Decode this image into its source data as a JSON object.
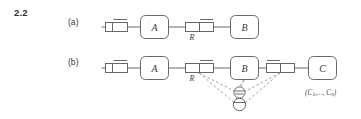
{
  "figure": {
    "number": "2.2",
    "panels": [
      {
        "id": "a",
        "label": "(a)"
      },
      {
        "id": "b",
        "label": "(b)"
      }
    ]
  },
  "row_a": {
    "source_name": "source-symbol",
    "blocks": [
      {
        "id": "A",
        "label": "A"
      },
      {
        "id": "B",
        "label": "B"
      }
    ],
    "channel": {
      "label": "R",
      "name": "channel-r"
    }
  },
  "row_b": {
    "source_name": "source-symbol",
    "blocks": [
      {
        "id": "A",
        "label": "A"
      },
      {
        "id": "B",
        "label": "B"
      },
      {
        "id": "C",
        "label": "C"
      }
    ],
    "channel": {
      "label": "R",
      "name": "channel-r"
    },
    "second_channel": {
      "label": "",
      "name": "channel-second"
    },
    "nodes": [
      {
        "id": "node-upper",
        "label": ""
      },
      {
        "id": "node-lower",
        "label": ""
      }
    ],
    "tuple_annotation": {
      "open": "(",
      "first": "C",
      "first_sub": "1",
      "ellipsis": ",...,",
      "last": "C",
      "last_sub": "n",
      "close": ")"
    }
  },
  "colors": {
    "stroke": "#58585a",
    "dashed": "#8d8d90",
    "text": "#3b3b3b",
    "background": "#ffffff"
  }
}
